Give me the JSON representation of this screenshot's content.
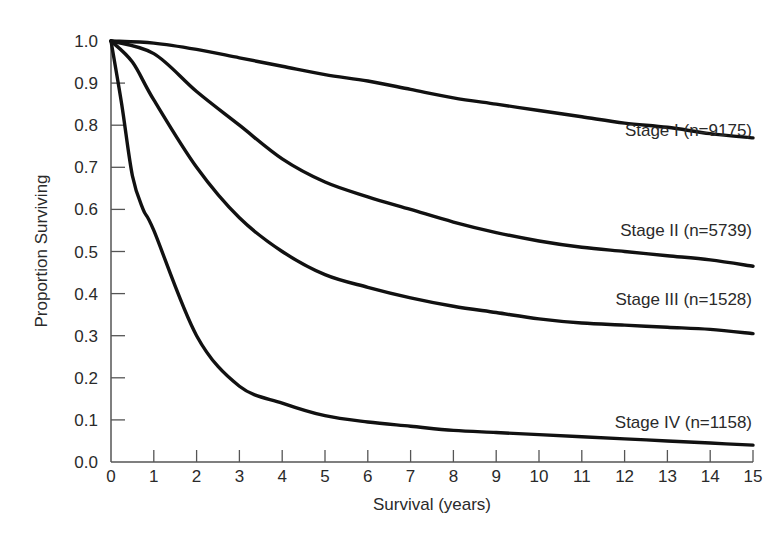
{
  "chart_data": {
    "type": "line",
    "title": "",
    "xlabel": "Survival (years)",
    "ylabel": "Proportion Surviving",
    "xlim": [
      0,
      15
    ],
    "ylim": [
      0.0,
      1.0
    ],
    "grid": false,
    "legend_position": "inline labels at right end of each curve",
    "x_ticks": [
      "0",
      "1",
      "2",
      "3",
      "4",
      "5",
      "6",
      "7",
      "8",
      "9",
      "10",
      "11",
      "12",
      "13",
      "14",
      "15"
    ],
    "y_ticks": [
      "0.0",
      "0.1",
      "0.2",
      "0.3",
      "0.4",
      "0.5",
      "0.6",
      "0.7",
      "0.8",
      "0.9",
      "1.0"
    ],
    "x": [
      0,
      1,
      2,
      3,
      4,
      5,
      6,
      7,
      8,
      9,
      10,
      11,
      12,
      13,
      14,
      15
    ],
    "series": [
      {
        "name": "Stage I (n=9175)",
        "values": [
          1.0,
          0.995,
          0.98,
          0.96,
          0.94,
          0.92,
          0.905,
          0.885,
          0.865,
          0.85,
          0.835,
          0.82,
          0.805,
          0.795,
          0.78,
          0.77
        ]
      },
      {
        "name": "Stage II (n=5739)",
        "values": [
          1.0,
          0.97,
          0.88,
          0.8,
          0.72,
          0.665,
          0.63,
          0.6,
          0.57,
          0.545,
          0.525,
          0.51,
          0.5,
          0.49,
          0.48,
          0.465
        ]
      },
      {
        "name": "Stage III (n=1528)",
        "values": [
          1.0,
          0.86,
          0.7,
          0.58,
          0.5,
          0.445,
          0.415,
          0.39,
          0.37,
          0.355,
          0.34,
          0.33,
          0.325,
          0.32,
          0.315,
          0.305
        ]
      },
      {
        "name": "Stage IV (n=1158)",
        "values": [
          1.0,
          0.55,
          0.3,
          0.18,
          0.14,
          0.11,
          0.095,
          0.085,
          0.075,
          0.07,
          0.065,
          0.06,
          0.055,
          0.05,
          0.045,
          0.04
        ]
      }
    ],
    "line_color": "#111111",
    "axis_color": "#555555"
  }
}
